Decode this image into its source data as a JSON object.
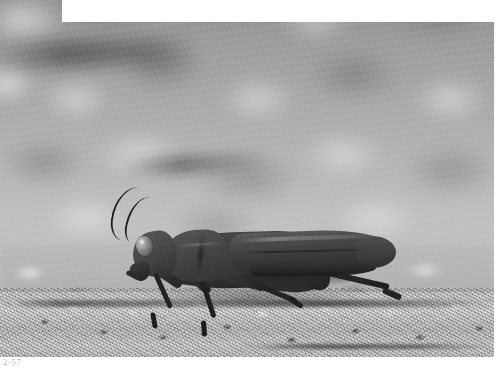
{
  "page": {
    "background_color": "#ffffff",
    "width": 501,
    "height": 369
  },
  "photograph": {
    "subject": "grasshopper",
    "medium": "black-and-white photograph",
    "description": "A dark grasshopper in left-facing profile resting on sunlit gravel, photographed with a shallow depth of field so the upper background is heavily blurred.",
    "frame": {
      "left": 0,
      "top": 0,
      "width": 494,
      "height": 357,
      "notch_width": 62,
      "notch_height": 22,
      "notch_color": "#ffffff"
    },
    "tones": {
      "subject_dark": "#262626",
      "subject_mid": "#4a4a4a",
      "subject_highlight": "#5b5b5b",
      "ground_light": "#d6d6d6",
      "ground_mid": "#bcbcbc",
      "background_blur": "#b6b6b6"
    },
    "parts": [
      {
        "name": "antenna-left",
        "label": "antenna"
      },
      {
        "name": "antenna-right",
        "label": "antenna"
      },
      {
        "name": "head",
        "label": "head"
      },
      {
        "name": "compound-eye",
        "label": "compound eye"
      },
      {
        "name": "pronotum",
        "label": "pronotum"
      },
      {
        "name": "forewing",
        "label": "forewing"
      },
      {
        "name": "hind-femur",
        "label": "hind femur"
      },
      {
        "name": "hind-tibia",
        "label": "hind tibia"
      },
      {
        "name": "middle-leg",
        "label": "middle leg"
      },
      {
        "name": "front-leg",
        "label": "front leg"
      }
    ]
  },
  "caption": {
    "text": "2-57"
  }
}
